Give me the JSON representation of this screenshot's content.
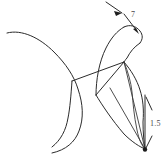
{
  "figure": {
    "background_color": "#ffffff",
    "stroke_color": "#2b2b2b",
    "width": 168,
    "height": 161,
    "annotations": [
      {
        "id": "dim-7",
        "label": "7",
        "position": {
          "x": 131,
          "y": 17
        },
        "leader": "angled arrow from upper-left vertex down to right contour"
      },
      {
        "id": "dim-1-5",
        "label": "1.5",
        "position": {
          "x": 150,
          "y": 124
        },
        "leader": "vertical dimension line with arrowheads at both ends"
      }
    ],
    "strokes": {
      "left_arc_label": "large left arc",
      "body_outline_label": "right body outline",
      "crossbar_label": "central crossbar",
      "fan_label": "converging fan lines"
    }
  }
}
